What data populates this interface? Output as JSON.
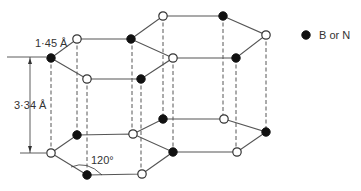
{
  "diagram": {
    "labels": {
      "bond_length": "1·45 Å",
      "interlayer_spacing": "3·34 Å",
      "bond_angle": "120°"
    },
    "legend": {
      "symbol": "filled-circle",
      "text": "B or N"
    },
    "colors": {
      "filled_atom": "#111111",
      "open_atom": "#ffffff",
      "bond": "#555555"
    },
    "layers": [
      {
        "name": "top-layer",
        "atoms": [
          {
            "x": 51,
            "y": 58,
            "type": "filled"
          },
          {
            "x": 77,
            "y": 39,
            "type": "open"
          },
          {
            "x": 131,
            "y": 39,
            "type": "filled"
          },
          {
            "x": 173,
            "y": 58,
            "type": "open"
          },
          {
            "x": 141,
            "y": 79,
            "type": "filled"
          },
          {
            "x": 87,
            "y": 79,
            "type": "open"
          },
          {
            "x": 163,
            "y": 16,
            "type": "open"
          },
          {
            "x": 223,
            "y": 16,
            "type": "filled"
          },
          {
            "x": 266,
            "y": 35,
            "type": "open"
          },
          {
            "x": 236,
            "y": 58,
            "type": "filled"
          }
        ]
      },
      {
        "name": "bottom-layer",
        "atoms": [
          {
            "x": 51,
            "y": 153,
            "type": "open"
          },
          {
            "x": 77,
            "y": 135,
            "type": "filled"
          },
          {
            "x": 133,
            "y": 134,
            "type": "open"
          },
          {
            "x": 173,
            "y": 152,
            "type": "filled"
          },
          {
            "x": 142,
            "y": 174,
            "type": "open"
          },
          {
            "x": 87,
            "y": 175,
            "type": "filled"
          },
          {
            "x": 163,
            "y": 119,
            "type": "filled"
          },
          {
            "x": 224,
            "y": 119,
            "type": "open"
          },
          {
            "x": 266,
            "y": 132,
            "type": "filled"
          },
          {
            "x": 237,
            "y": 152,
            "type": "open"
          }
        ]
      }
    ]
  }
}
